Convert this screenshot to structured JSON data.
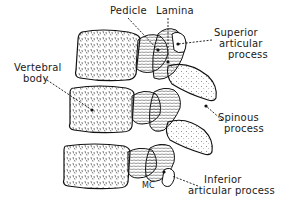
{
  "diagram": {
    "title": "",
    "signature": "MC",
    "labels": {
      "pedicle": "Pedicle",
      "lamina": "Lamina",
      "superior_articular_process_1": "Superior",
      "superior_articular_process_2": "articular",
      "superior_articular_process_3": "process",
      "vertebral_body_1": "Vertebral",
      "vertebral_body_2": "body",
      "spinous_process_1": "Spinous",
      "spinous_process_2": "process",
      "inferior_articular_process_1": "Inferior",
      "inferior_articular_process_2": "articular process"
    },
    "colors": {
      "ink": "#1a1a1a",
      "background": "#ffffff"
    }
  }
}
